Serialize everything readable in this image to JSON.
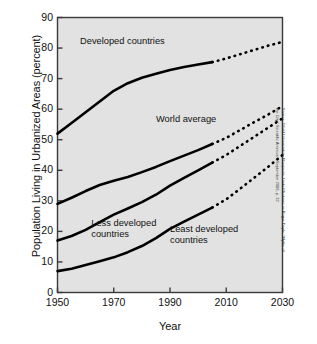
{
  "chart_data": {
    "type": "line",
    "title": "",
    "xlabel": "Year",
    "ylabel": "Population Living in Urbanized Areas (percent)",
    "xlim": [
      1950,
      2030
    ],
    "ylim": [
      0,
      90
    ],
    "xticks": [
      1950,
      1970,
      1990,
      2010,
      2030
    ],
    "yticks": [
      0,
      10,
      20,
      30,
      40,
      50,
      60,
      70,
      80,
      90
    ],
    "grid": false,
    "legend": "inline-annotations",
    "projection_starts": 2005,
    "x": [
      1950,
      1955,
      1960,
      1965,
      1970,
      1975,
      1980,
      1985,
      1990,
      1995,
      2000,
      2005,
      2010,
      2015,
      2020,
      2025,
      2030
    ],
    "series": [
      {
        "name": "Developed countries",
        "values": [
          52.0,
          55.5,
          59.0,
          62.5,
          66.0,
          68.5,
          70.3,
          71.6,
          72.8,
          73.8,
          74.6,
          75.4,
          76.6,
          78.0,
          79.4,
          80.8,
          82.0
        ],
        "solid_until": 2005
      },
      {
        "name": "World average",
        "values": [
          29.0,
          31.0,
          33.2,
          35.2,
          36.6,
          37.8,
          39.4,
          41.1,
          43.0,
          44.8,
          46.6,
          48.6,
          50.6,
          53.2,
          55.8,
          58.3,
          61.0
        ],
        "solid_until": 2005
      },
      {
        "name": "Less developed countries",
        "values": [
          17.0,
          18.5,
          20.5,
          23.0,
          25.5,
          27.5,
          29.6,
          32.0,
          35.0,
          37.5,
          40.0,
          42.5,
          45.0,
          48.0,
          51.0,
          54.0,
          57.0
        ],
        "solid_until": 2005
      },
      {
        "name": "Least developed countries",
        "values": [
          7.0,
          7.8,
          9.0,
          10.2,
          11.5,
          13.2,
          15.2,
          17.8,
          20.8,
          23.2,
          25.5,
          27.8,
          30.5,
          34.0,
          37.6,
          41.2,
          45.0
        ],
        "solid_until": 2005
      }
    ],
    "annotations": [
      {
        "text": "Developed countries",
        "x": 1958,
        "y": 82.0
      },
      {
        "text": "World average",
        "x": 1985,
        "y": 56.5
      },
      {
        "text": "Less developed\ncountries",
        "x": 1962,
        "y": 22.5
      },
      {
        "text": "Least developed\ncountries",
        "x": 1990,
        "y": 20.5
      }
    ],
    "colors": {
      "plot_background": "#e2e2e2",
      "line": "#000000",
      "axis": "#3a3a3a",
      "text": "#111111",
      "page_background": "#ffffff"
    }
  },
  "source_note": "Source: World Urbanization Prospects, United Nations, in Roger Doyle, “Myths of the City,” Scientific American, September 2006, p. 32"
}
